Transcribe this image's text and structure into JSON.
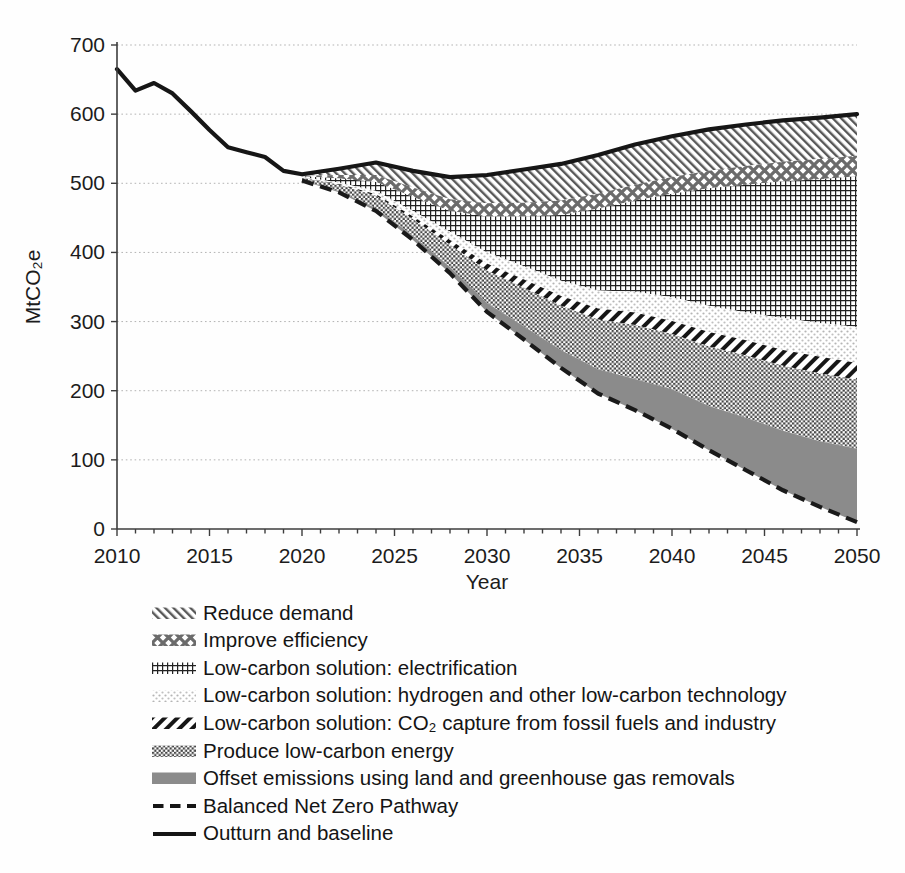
{
  "chart_data": {
    "type": "area",
    "subtype": "stacked-wedges-below-baseline",
    "title": "",
    "xlabel": "Year",
    "ylabel": "MtCO₂e",
    "x_axis": {
      "label": "Year",
      "min": 2010,
      "max": 2050,
      "ticks": [
        2010,
        2015,
        2020,
        2025,
        2030,
        2035,
        2040,
        2045,
        2050
      ],
      "minor_tick_interval": 1
    },
    "y_axis": {
      "label": "MtCO₂e",
      "min": 0,
      "max": 700,
      "ticks": [
        0,
        100,
        200,
        300,
        400,
        500,
        600,
        700
      ],
      "gridlines": "dotted-horizontal"
    },
    "legend_position": "below-left",
    "outturn_baseline": {
      "label": "Outturn and baseline",
      "style": "solid-black-line",
      "years": [
        2010,
        2011,
        2012,
        2013,
        2014,
        2015,
        2016,
        2017,
        2018,
        2019,
        2020,
        2022,
        2024,
        2026,
        2028,
        2030,
        2032,
        2034,
        2036,
        2038,
        2040,
        2042,
        2044,
        2046,
        2048,
        2050
      ],
      "values": [
        665,
        634,
        645,
        630,
        604,
        577,
        552,
        545,
        538,
        518,
        513,
        521,
        530,
        518,
        509,
        512,
        520,
        528,
        541,
        556,
        568,
        578,
        585,
        591,
        595,
        600
      ]
    },
    "bnzp": {
      "label": "Balanced Net Zero Pathway",
      "style": "dashed-black-line",
      "years": [
        2020,
        2022,
        2024,
        2026,
        2028,
        2030,
        2032,
        2034,
        2036,
        2038,
        2040,
        2042,
        2044,
        2046,
        2048,
        2050
      ],
      "values": [
        504,
        487,
        460,
        418,
        370,
        314,
        274,
        233,
        196,
        172,
        145,
        114,
        85,
        56,
        32,
        10
      ]
    },
    "wedge_years": [
      2020,
      2022,
      2024,
      2026,
      2028,
      2030,
      2032,
      2034,
      2036,
      2038,
      2040,
      2042,
      2044,
      2046,
      2048,
      2050
    ],
    "wedges_note": "Abatement wedges stacked downward from the Outturn-and-baseline line; values are wedge thickness in MtCO2e. Bottom of stack equals the Balanced Net Zero Pathway.",
    "wedges": [
      {
        "id": "reduce-demand",
        "label": "Reduce demand",
        "pattern": "diagonal-hatch-backslash",
        "color": "#585858",
        "values": [
          2,
          9,
          18,
          24,
          32,
          41,
          48,
          53,
          56,
          58,
          59,
          60,
          60,
          60,
          60,
          60
        ]
      },
      {
        "id": "improve-efficiency",
        "label": "Improve efficiency",
        "pattern": "diamond-crosshatch",
        "color": "#6b6b6b",
        "values": [
          1,
          5,
          10,
          14,
          17,
          19,
          20,
          21,
          22,
          23,
          24,
          25,
          27,
          28,
          29,
          30
        ]
      },
      {
        "id": "electrification",
        "label": "Low-carbon solution: electrification",
        "pattern": "fine-grid",
        "color": "#222222",
        "values": [
          1,
          6,
          13,
          20,
          30,
          52,
          72,
          95,
          118,
          132,
          150,
          170,
          185,
          198,
          208,
          218
        ]
      },
      {
        "id": "hydrogen",
        "label": "Low-carbon solution: hydrogen and other low-carbon technology",
        "pattern": "light-dots",
        "color": "#b5b5b5",
        "values": [
          1,
          2,
          5,
          8,
          12,
          16,
          19,
          22,
          26,
          30,
          34,
          38,
          40,
          46,
          49,
          52
        ]
      },
      {
        "id": "co2-capture",
        "label": "Low-carbon solution: CO₂ capture from fossil fuels and industry",
        "pattern": "bold-diagonal-stripes-slash",
        "color": "#161616",
        "values": [
          0,
          1,
          2,
          4,
          7,
          10,
          12,
          14,
          16,
          18,
          19,
          21,
          22,
          23,
          24,
          24
        ]
      },
      {
        "id": "produce-lowcarbon",
        "label": "Produce low-carbon energy",
        "pattern": "checkerboard",
        "color": "#474747",
        "values": [
          3,
          9,
          18,
          24,
          32,
          47,
          56,
          64,
          72,
          78,
          80,
          86,
          90,
          94,
          98,
          100
        ]
      },
      {
        "id": "offsets",
        "label": "Offset emissions using land and greenhouse gas removals",
        "pattern": "solid-gray",
        "color": "#8b8b8b",
        "values": [
          1,
          2,
          4,
          6,
          9,
          13,
          19,
          26,
          35,
          45,
          57,
          64,
          76,
          86,
          95,
          106
        ]
      }
    ]
  }
}
